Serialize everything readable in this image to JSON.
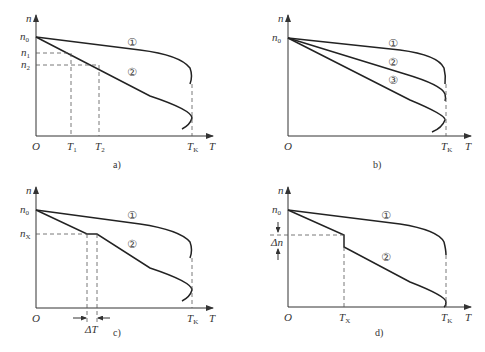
{
  "figure": {
    "panels": [
      {
        "id": "a",
        "caption": "a)",
        "y_axis_label": "n",
        "x_axis_label": "T",
        "origin_label": "O",
        "y_ticks": [
          {
            "label": "n",
            "sub": "0"
          },
          {
            "label": "n",
            "sub": "1"
          },
          {
            "label": "n",
            "sub": "2"
          }
        ],
        "x_ticks": [
          {
            "label": "T",
            "sub": "1"
          },
          {
            "label": "T",
            "sub": "2"
          },
          {
            "label": "T",
            "sub": "K"
          }
        ],
        "curve_labels": [
          "①",
          "②"
        ]
      },
      {
        "id": "b",
        "caption": "b)",
        "y_axis_label": "n",
        "x_axis_label": "T",
        "origin_label": "O",
        "y_ticks": [
          {
            "label": "n",
            "sub": "0"
          }
        ],
        "x_ticks": [
          {
            "label": "T",
            "sub": "K"
          }
        ],
        "curve_labels": [
          "①",
          "②",
          "③"
        ]
      },
      {
        "id": "c",
        "caption": "c)",
        "y_axis_label": "n",
        "x_axis_label": "T",
        "origin_label": "O",
        "y_ticks": [
          {
            "label": "n",
            "sub": "0"
          },
          {
            "label": "n",
            "sub": "X"
          }
        ],
        "x_ticks": [
          {
            "label": "T",
            "sub": "K"
          }
        ],
        "interval_label": "ΔT",
        "curve_labels": [
          "①",
          "②"
        ]
      },
      {
        "id": "d",
        "caption": "d)",
        "y_axis_label": "n",
        "x_axis_label": "T",
        "origin_label": "O",
        "y_ticks": [
          {
            "label": "n",
            "sub": "0"
          }
        ],
        "delta_label": "Δn",
        "x_ticks": [
          {
            "label": "T",
            "sub": "X"
          },
          {
            "label": "T",
            "sub": "K"
          }
        ],
        "curve_labels": [
          "①",
          "②"
        ]
      }
    ]
  }
}
